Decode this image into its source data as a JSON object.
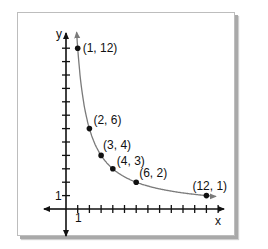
{
  "chart_data": {
    "type": "line",
    "title": "",
    "xlabel": "x",
    "ylabel": "y",
    "x_tick_label": "1",
    "y_tick_label": "1",
    "xlim": [
      0,
      12.5
    ],
    "ylim": [
      0,
      12.5
    ],
    "grid": false,
    "curve": "y = 12/x",
    "points": [
      {
        "x": 1,
        "y": 12,
        "label": "(1, 12)"
      },
      {
        "x": 2,
        "y": 6,
        "label": "(2, 6)"
      },
      {
        "x": 3,
        "y": 4,
        "label": "(3, 4)"
      },
      {
        "x": 4,
        "y": 3,
        "label": "(4, 3)"
      },
      {
        "x": 6,
        "y": 2,
        "label": "(6, 2)"
      },
      {
        "x": 12,
        "y": 1,
        "label": "(12, 1)"
      }
    ],
    "colors": {
      "curve": "#7a7a7a",
      "axes": "#111111",
      "points": "#111111"
    }
  }
}
